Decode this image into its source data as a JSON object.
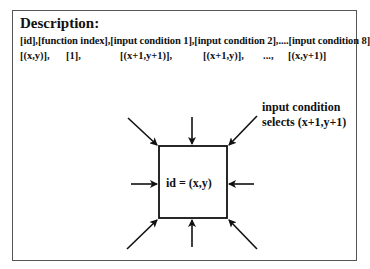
{
  "description": {
    "title": "Description:",
    "header_line": "[id],[function index],[input condition 1],[input condition 2],....[input condition 8]",
    "example_row": [
      {
        "text": "[(x,y)],",
        "x": 20
      },
      {
        "text": "[1],",
        "x": 66
      },
      {
        "text": "[(x+1,y+1)],",
        "x": 120
      },
      {
        "text": "[(x+1,y)],",
        "x": 203
      },
      {
        "text": "...,",
        "x": 263
      },
      {
        "text": "[(x,y+1)]",
        "x": 288
      }
    ]
  },
  "diagram": {
    "cell_label": "id = (x,y)",
    "callout_line1": "input condition",
    "callout_line2": "selects (x+1,y+1)",
    "arrow_count": 8
  }
}
